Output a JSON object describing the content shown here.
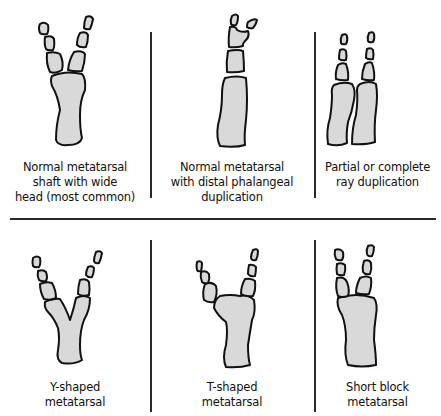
{
  "figure": {
    "bone_fill": "#d9d9d9",
    "outline_color": "#111111",
    "divider_color": "#2a2a2a",
    "panels": [
      {
        "id": "p1",
        "row": 1,
        "col": 1,
        "caption_lines": [
          "Normal metatarsal",
          "shaft with wide",
          "head (most common)"
        ]
      },
      {
        "id": "p2",
        "row": 1,
        "col": 2,
        "caption_lines": [
          "Normal metatarsal",
          "with distal phalangeal",
          "duplication"
        ]
      },
      {
        "id": "p3",
        "row": 1,
        "col": 3,
        "caption_lines": [
          "Partial or complete",
          "ray duplication"
        ]
      },
      {
        "id": "p4",
        "row": 2,
        "col": 1,
        "caption_lines": [
          "Y-shaped",
          "metatarsal"
        ]
      },
      {
        "id": "p5",
        "row": 2,
        "col": 2,
        "caption_lines": [
          "T-shaped",
          "metatarsal"
        ]
      },
      {
        "id": "p6",
        "row": 2,
        "col": 3,
        "caption_lines": [
          "Short block",
          "metatarsal"
        ]
      }
    ]
  }
}
